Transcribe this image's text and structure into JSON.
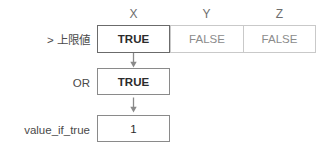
{
  "diagram": {
    "type": "logic-flow",
    "columns": [
      {
        "id": "x",
        "header": "X"
      },
      {
        "id": "y",
        "header": "Y"
      },
      {
        "id": "z",
        "header": "Z"
      }
    ],
    "rows": [
      {
        "id": "upper-limit-test",
        "label": "> 上限値",
        "kind": "table",
        "cells": [
          {
            "column": "X",
            "value": "TRUE",
            "emphasized": true
          },
          {
            "column": "Y",
            "value": "FALSE",
            "emphasized": false
          },
          {
            "column": "Z",
            "value": "FALSE",
            "emphasized": false
          }
        ]
      },
      {
        "id": "or-result",
        "label": "OR",
        "kind": "box",
        "value": "TRUE"
      },
      {
        "id": "value-if-true",
        "label": "value_if_true",
        "kind": "box",
        "value": "1"
      }
    ],
    "connectors": [
      {
        "id": "arrow-1",
        "from": "upper-limit-test",
        "to": "or-result",
        "glyph": "arrow-down-icon"
      },
      {
        "id": "arrow-2",
        "from": "or-result",
        "to": "value-if-true",
        "glyph": "arrow-down-icon"
      }
    ],
    "colors": {
      "background": "#ffffff",
      "text": "#3a3a3a",
      "muted_text": "#8c8c8c",
      "emphasized_text": "#2b2b2b",
      "border": "#c9c9c9",
      "emphasized_border": "#6b6b6b",
      "box_border": "#8a8a8a",
      "arrow": "#8a8a8a"
    }
  }
}
